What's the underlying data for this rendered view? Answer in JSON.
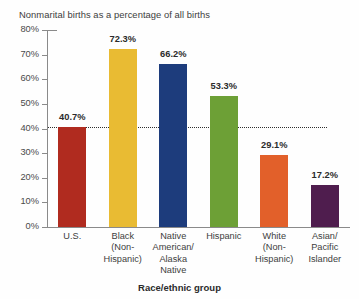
{
  "chart_data": {
    "type": "bar",
    "title": "Nonmarital births as a percentage of all births",
    "xlabel": "Race/ethnic group",
    "ylabel": "",
    "ylim": [
      0,
      80
    ],
    "grid": false,
    "legend": "none",
    "y_ticks": [
      "0%",
      "10%",
      "20%",
      "30%",
      "40%",
      "50%",
      "60%",
      "70%",
      "80%"
    ],
    "y_tick_values": [
      0,
      10,
      20,
      30,
      40,
      50,
      60,
      70,
      80
    ],
    "categories": [
      "U.S.",
      "Black\n(Non-\nHispanic)",
      "Native\nAmerican/\nAlaska\nNative",
      "Hispanic",
      "White\n(Non-\nHispanic)",
      "Asian/\nPacific\nIslander"
    ],
    "values": [
      40.7,
      72.3,
      66.2,
      53.3,
      29.1,
      17.2
    ],
    "value_labels": [
      "40.7%",
      "72.3%",
      "66.2%",
      "53.3%",
      "29.1%",
      "17.2%"
    ],
    "bar_colors": [
      "#b02b1f",
      "#e9bb33",
      "#1d3c7c",
      "#6da036",
      "#e2602a",
      "#4f1d4e"
    ],
    "annotations": [
      {
        "type": "reference-line",
        "style": "dotted",
        "value": 40.7,
        "label": ""
      }
    ]
  }
}
